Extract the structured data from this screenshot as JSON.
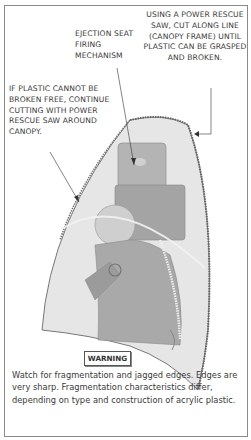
{
  "diagram": {
    "callouts": {
      "saw_cut": "USING A POWER RESCUE SAW, CUT ALONG LINE (CANOPY FRAME) UNTIL PLASTIC CAN BE GRASPED AND BROKEN.",
      "ejection_seat": "EJECTION SEAT FIRING MECHANISM",
      "continue_cutting": "IF PLASTIC CANNOT BE BROKEN FREE, CONTINUE CUTTING WITH POWER RESCUE SAW AROUND CANOPY."
    },
    "warning": {
      "label": "WARNING",
      "text": "Watch for fragmentation and jagged edges. Edges are very sharp. Fragmentation characteristics differ, depending on type and construction of acrylic plastic."
    },
    "colors": {
      "canopy_fill": "#e4e4e4",
      "figure_fill": "#a8a8a8",
      "frame_line": "#555555",
      "border": "#8a8a8a"
    }
  }
}
